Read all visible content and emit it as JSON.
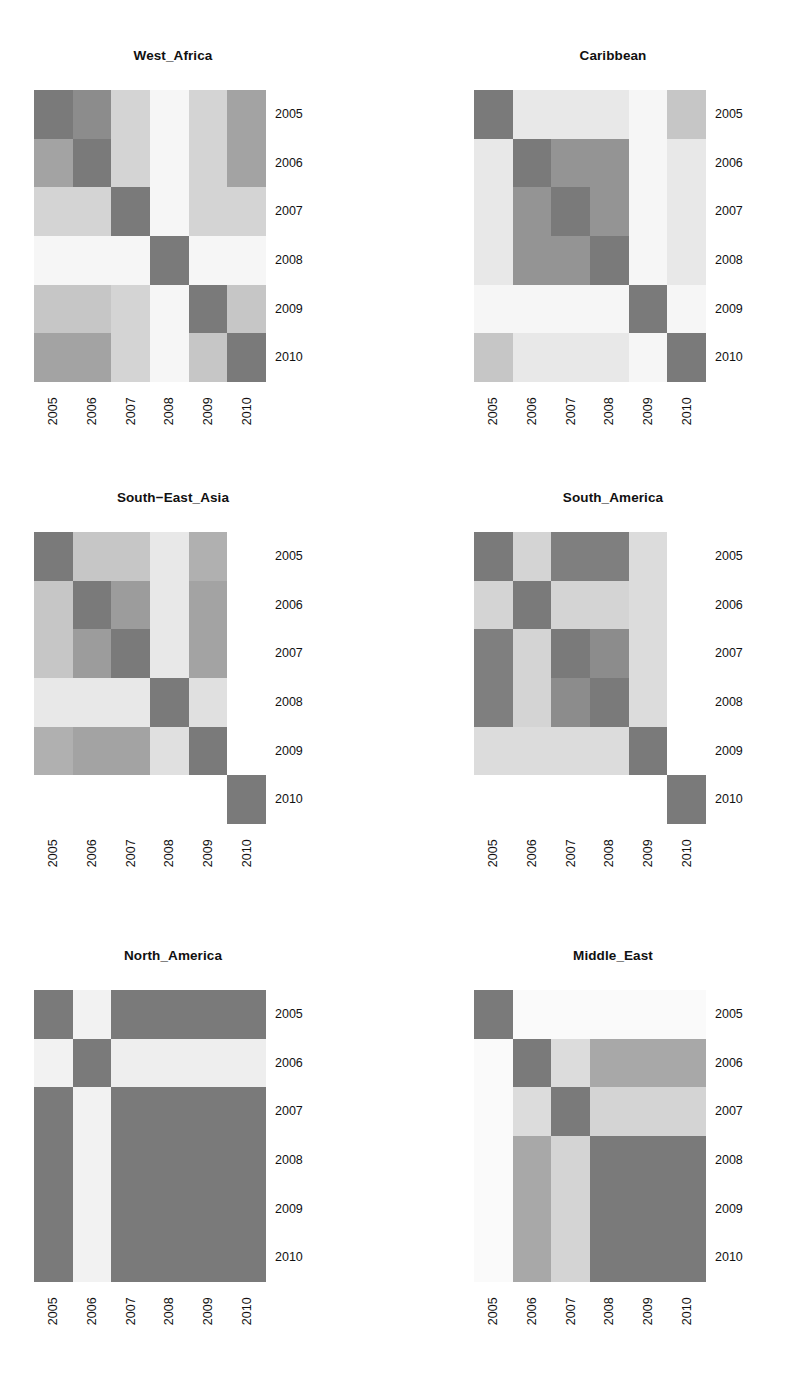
{
  "figure": {
    "kind": "small-multiples-heatmap-matrix",
    "rows": 3,
    "cols": 2,
    "background": "#ffffff"
  },
  "axis": {
    "x_ticks": [
      "2005",
      "2006",
      "2007",
      "2008",
      "2009",
      "2010"
    ],
    "y_ticks": [
      "2005",
      "2006",
      "2007",
      "2008",
      "2009",
      "2010"
    ],
    "x_label_rotation": "90",
    "y_label_side": "right"
  },
  "palette": {
    "level_0": "#f6f6f6",
    "level_1": "#e8e8e8",
    "level_2": "#d4d4d4",
    "level_3": "#bdbdbd",
    "level_4": "#a3a3a3",
    "level_5": "#8c8c8c",
    "level_6": "#7a7a7a"
  },
  "panels": [
    {
      "id": "west-africa",
      "title": "West_Africa"
    },
    {
      "id": "caribbean",
      "title": "Caribbean"
    },
    {
      "id": "south-east-asia",
      "title": "South−East_Asia"
    },
    {
      "id": "south-america",
      "title": "South_America"
    },
    {
      "id": "north-america",
      "title": "North_America"
    },
    {
      "id": "middle-east",
      "title": "Middle_East"
    }
  ],
  "chart_data": [
    {
      "type": "heatmap",
      "title": "West_Africa",
      "xlabel": "",
      "ylabel": "",
      "x": [
        "2005",
        "2006",
        "2007",
        "2008",
        "2009",
        "2010"
      ],
      "y": [
        "2005",
        "2006",
        "2007",
        "2008",
        "2009",
        "2010"
      ],
      "zlim": [
        0,
        6
      ],
      "grid": false,
      "legend": "none",
      "values": [
        [
          6,
          5,
          3,
          0,
          2,
          4
        ],
        [
          4,
          6,
          2,
          0,
          2,
          4
        ],
        [
          2,
          2,
          6,
          0,
          2,
          2
        ],
        [
          0,
          0,
          0,
          6,
          0,
          0
        ],
        [
          3,
          3,
          2,
          0,
          6,
          3
        ],
        [
          4,
          4,
          2,
          0,
          3,
          6
        ]
      ],
      "colors": [
        [
          "#7a7a7a",
          "#8c8c8c",
          "#d4d4d4",
          "#f6f6f6",
          "#d4d4d4",
          "#a3a3a3"
        ],
        [
          "#a3a3a3",
          "#7a7a7a",
          "#d4d4d4",
          "#f6f6f6",
          "#d4d4d4",
          "#a3a3a3"
        ],
        [
          "#d4d4d4",
          "#d4d4d4",
          "#7a7a7a",
          "#f6f6f6",
          "#d4d4d4",
          "#d4d4d4"
        ],
        [
          "#f6f6f6",
          "#f6f6f6",
          "#f6f6f6",
          "#7a7a7a",
          "#f6f6f6",
          "#f6f6f6"
        ],
        [
          "#c6c6c6",
          "#c6c6c6",
          "#d4d4d4",
          "#f6f6f6",
          "#7a7a7a",
          "#c6c6c6"
        ],
        [
          "#a3a3a3",
          "#a3a3a3",
          "#d4d4d4",
          "#f6f6f6",
          "#c6c6c6",
          "#7a7a7a"
        ]
      ]
    },
    {
      "type": "heatmap",
      "title": "Caribbean",
      "xlabel": "",
      "ylabel": "",
      "x": [
        "2005",
        "2006",
        "2007",
        "2008",
        "2009",
        "2010"
      ],
      "y": [
        "2005",
        "2006",
        "2007",
        "2008",
        "2009",
        "2010"
      ],
      "zlim": [
        0,
        6
      ],
      "grid": false,
      "legend": "none",
      "values": [
        [
          6,
          1,
          1,
          1,
          0,
          3
        ],
        [
          1,
          6,
          5,
          5,
          0,
          1
        ],
        [
          1,
          5,
          6,
          5,
          0,
          1
        ],
        [
          1,
          5,
          5,
          6,
          0,
          1
        ],
        [
          0,
          0,
          0,
          0,
          6,
          0
        ],
        [
          3,
          1,
          1,
          1,
          0,
          6
        ]
      ],
      "colors": [
        [
          "#7a7a7a",
          "#e8e8e8",
          "#e8e8e8",
          "#e8e8e8",
          "#f6f6f6",
          "#c6c6c6"
        ],
        [
          "#e8e8e8",
          "#7a7a7a",
          "#949494",
          "#949494",
          "#f6f6f6",
          "#e8e8e8"
        ],
        [
          "#e8e8e8",
          "#949494",
          "#7a7a7a",
          "#949494",
          "#f6f6f6",
          "#e8e8e8"
        ],
        [
          "#e8e8e8",
          "#949494",
          "#949494",
          "#7a7a7a",
          "#f6f6f6",
          "#e8e8e8"
        ],
        [
          "#f6f6f6",
          "#f6f6f6",
          "#f6f6f6",
          "#f6f6f6",
          "#7a7a7a",
          "#f6f6f6"
        ],
        [
          "#c6c6c6",
          "#e8e8e8",
          "#e8e8e8",
          "#e8e8e8",
          "#f6f6f6",
          "#7a7a7a"
        ]
      ]
    },
    {
      "type": "heatmap",
      "title": "South−East_Asia",
      "xlabel": "",
      "ylabel": "",
      "x": [
        "2005",
        "2006",
        "2007",
        "2008",
        "2009",
        "2010"
      ],
      "y": [
        "2005",
        "2006",
        "2007",
        "2008",
        "2009",
        "2010"
      ],
      "zlim": [
        0,
        6
      ],
      "grid": false,
      "legend": "none",
      "values": [
        [
          6,
          3,
          3,
          1,
          4,
          0
        ],
        [
          3,
          6,
          5,
          1,
          4,
          0
        ],
        [
          3,
          5,
          6,
          1,
          4,
          0
        ],
        [
          1,
          1,
          1,
          6,
          1,
          0
        ],
        [
          4,
          4,
          4,
          1,
          6,
          0
        ],
        [
          0,
          0,
          0,
          0,
          0,
          6
        ]
      ],
      "colors": [
        [
          "#7a7a7a",
          "#c6c6c6",
          "#c6c6c6",
          "#e8e8e8",
          "#b0b0b0",
          "#ffffff"
        ],
        [
          "#c6c6c6",
          "#7a7a7a",
          "#9c9c9c",
          "#e8e8e8",
          "#a3a3a3",
          "#ffffff"
        ],
        [
          "#c6c6c6",
          "#9c9c9c",
          "#7a7a7a",
          "#e8e8e8",
          "#a3a3a3",
          "#ffffff"
        ],
        [
          "#e8e8e8",
          "#e8e8e8",
          "#e8e8e8",
          "#7a7a7a",
          "#e0e0e0",
          "#ffffff"
        ],
        [
          "#b0b0b0",
          "#a3a3a3",
          "#a3a3a3",
          "#e0e0e0",
          "#7a7a7a",
          "#ffffff"
        ],
        [
          "#ffffff",
          "#ffffff",
          "#ffffff",
          "#ffffff",
          "#ffffff",
          "#7a7a7a"
        ]
      ]
    },
    {
      "type": "heatmap",
      "title": "South_America",
      "xlabel": "",
      "ylabel": "",
      "x": [
        "2005",
        "2006",
        "2007",
        "2008",
        "2009",
        "2010"
      ],
      "y": [
        "2005",
        "2006",
        "2007",
        "2008",
        "2009",
        "2010"
      ],
      "zlim": [
        0,
        6
      ],
      "grid": false,
      "legend": "none",
      "values": [
        [
          6,
          2,
          5,
          5,
          1,
          0
        ],
        [
          2,
          6,
          2,
          2,
          1,
          0
        ],
        [
          5,
          2,
          6,
          5,
          1,
          0
        ],
        [
          5,
          2,
          5,
          6,
          1,
          0
        ],
        [
          1,
          1,
          1,
          1,
          6,
          0
        ],
        [
          0,
          0,
          0,
          0,
          0,
          6
        ]
      ],
      "colors": [
        [
          "#7a7a7a",
          "#d4d4d4",
          "#7f7f7f",
          "#7f7f7f",
          "#dcdcdc",
          "#ffffff"
        ],
        [
          "#d4d4d4",
          "#7a7a7a",
          "#d4d4d4",
          "#d4d4d4",
          "#dcdcdc",
          "#ffffff"
        ],
        [
          "#7f7f7f",
          "#d4d4d4",
          "#7a7a7a",
          "#8c8c8c",
          "#dcdcdc",
          "#ffffff"
        ],
        [
          "#7f7f7f",
          "#d4d4d4",
          "#8c8c8c",
          "#7a7a7a",
          "#dcdcdc",
          "#ffffff"
        ],
        [
          "#dcdcdc",
          "#dcdcdc",
          "#dcdcdc",
          "#dcdcdc",
          "#7a7a7a",
          "#ffffff"
        ],
        [
          "#ffffff",
          "#ffffff",
          "#ffffff",
          "#ffffff",
          "#ffffff",
          "#7a7a7a"
        ]
      ]
    },
    {
      "type": "heatmap",
      "title": "North_America",
      "xlabel": "",
      "ylabel": "",
      "x": [
        "2005",
        "2006",
        "2007",
        "2008",
        "2009",
        "2010"
      ],
      "y": [
        "2005",
        "2006",
        "2007",
        "2008",
        "2009",
        "2010"
      ],
      "zlim": [
        0,
        6
      ],
      "grid": false,
      "legend": "none",
      "values": [
        [
          6,
          0,
          6,
          6,
          6,
          6
        ],
        [
          0,
          6,
          0,
          0,
          0,
          0
        ],
        [
          6,
          0,
          6,
          6,
          6,
          6
        ],
        [
          6,
          0,
          6,
          6,
          6,
          6
        ],
        [
          6,
          0,
          6,
          6,
          6,
          6
        ],
        [
          6,
          0,
          6,
          6,
          6,
          6
        ]
      ],
      "colors": [
        [
          "#7a7a7a",
          "#f2f2f2",
          "#7a7a7a",
          "#7a7a7a",
          "#7a7a7a",
          "#7a7a7a"
        ],
        [
          "#f2f2f2",
          "#7a7a7a",
          "#eeeeee",
          "#eeeeee",
          "#eeeeee",
          "#eeeeee"
        ],
        [
          "#7a7a7a",
          "#f2f2f2",
          "#7a7a7a",
          "#7a7a7a",
          "#7a7a7a",
          "#7a7a7a"
        ],
        [
          "#7a7a7a",
          "#f2f2f2",
          "#7a7a7a",
          "#7a7a7a",
          "#7a7a7a",
          "#7a7a7a"
        ],
        [
          "#7a7a7a",
          "#f2f2f2",
          "#7a7a7a",
          "#7a7a7a",
          "#7a7a7a",
          "#7a7a7a"
        ],
        [
          "#7a7a7a",
          "#f2f2f2",
          "#7a7a7a",
          "#7a7a7a",
          "#7a7a7a",
          "#7a7a7a"
        ]
      ]
    },
    {
      "type": "heatmap",
      "title": "Middle_East",
      "xlabel": "",
      "ylabel": "",
      "x": [
        "2005",
        "2006",
        "2007",
        "2008",
        "2009",
        "2010"
      ],
      "y": [
        "2005",
        "2006",
        "2007",
        "2008",
        "2009",
        "2010"
      ],
      "zlim": [
        0,
        6
      ],
      "grid": false,
      "legend": "none",
      "values": [
        [
          6,
          0,
          0,
          0,
          0,
          0
        ],
        [
          0,
          6,
          2,
          4,
          4,
          4
        ],
        [
          0,
          2,
          6,
          2,
          2,
          2
        ],
        [
          0,
          4,
          2,
          6,
          6,
          6
        ],
        [
          0,
          4,
          2,
          6,
          6,
          6
        ],
        [
          0,
          4,
          2,
          6,
          6,
          6
        ]
      ],
      "colors": [
        [
          "#7a7a7a",
          "#fafafa",
          "#fafafa",
          "#fafafa",
          "#fafafa",
          "#fafafa"
        ],
        [
          "#fafafa",
          "#7a7a7a",
          "#dcdcdc",
          "#a8a8a8",
          "#a8a8a8",
          "#a8a8a8"
        ],
        [
          "#fafafa",
          "#dcdcdc",
          "#7a7a7a",
          "#d4d4d4",
          "#d4d4d4",
          "#d4d4d4"
        ],
        [
          "#fafafa",
          "#a8a8a8",
          "#d4d4d4",
          "#7a7a7a",
          "#7a7a7a",
          "#7a7a7a"
        ],
        [
          "#fafafa",
          "#a8a8a8",
          "#d4d4d4",
          "#7a7a7a",
          "#7a7a7a",
          "#7a7a7a"
        ],
        [
          "#fafafa",
          "#a8a8a8",
          "#d4d4d4",
          "#7a7a7a",
          "#7a7a7a",
          "#7a7a7a"
        ]
      ]
    }
  ]
}
